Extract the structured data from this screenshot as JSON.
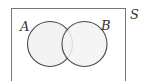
{
  "diagram": {
    "type": "venn",
    "universal_set": {
      "label": "S",
      "x": 11,
      "y": 8,
      "width": 115,
      "height": 74
    },
    "sets": [
      {
        "label": "A",
        "cx": 50,
        "cy": 44,
        "r": 22.5,
        "label_x": 22,
        "label_y": 30
      },
      {
        "label": "B",
        "cx": 84.5,
        "cy": 44,
        "r": 22.5,
        "label_x": 103,
        "label_y": 30
      }
    ],
    "colors": {
      "stroke": "#4a4a4a",
      "fill": "#f3f3f3",
      "background": "#ffffff",
      "frame": "#777777"
    }
  }
}
